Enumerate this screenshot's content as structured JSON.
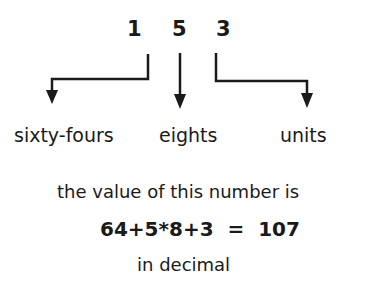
{
  "number": {
    "digits": [
      "1",
      "5",
      "3"
    ]
  },
  "place_labels": [
    "sixty-fours",
    "eights",
    "units"
  ],
  "explanation": {
    "line1": "the value of this number is",
    "equation": "64+5*8+3  =  107",
    "line3": "in decimal"
  },
  "colors": {
    "ink": "#1a1a1a",
    "background": "#ffffff"
  }
}
